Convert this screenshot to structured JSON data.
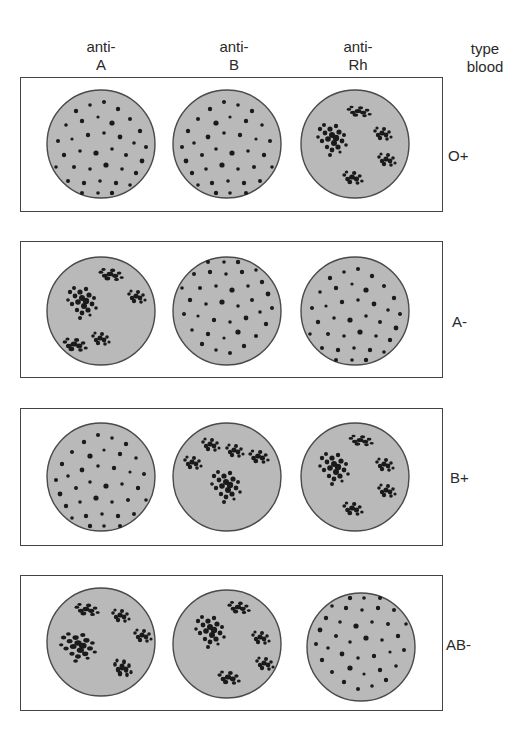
{
  "columns": [
    {
      "line1": "anti-",
      "line2": "A"
    },
    {
      "line1": "anti-",
      "line2": "B"
    },
    {
      "line1": "anti-",
      "line2": "Rh"
    }
  ],
  "type_header": {
    "line1": "type",
    "line2": "blood"
  },
  "rows": [
    {
      "blood_type": "O+",
      "results": [
        "no agglutination",
        "no agglutination",
        "agglutination"
      ]
    },
    {
      "blood_type": "A-",
      "results": [
        "agglutination",
        "no agglutination",
        "no agglutination"
      ]
    },
    {
      "blood_type": "B+",
      "results": [
        "no agglutination",
        "agglutination",
        "agglutination"
      ]
    },
    {
      "blood_type": "AB-",
      "results": [
        "agglutination",
        "agglutination",
        "no agglutination"
      ]
    }
  ],
  "colors": {
    "plate_fill": "#b9b9b9",
    "plate_border": "#4a4a4a",
    "dots": "#1a1a1a",
    "panel_border": "#444444"
  }
}
